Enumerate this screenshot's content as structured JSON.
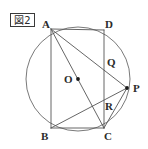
{
  "figure": {
    "caption_box": {
      "label": "図2",
      "x": 10,
      "y": 13,
      "width": 25,
      "height": 14
    },
    "canvas": {
      "width": 148,
      "height": 149,
      "background": "#ffffff"
    },
    "style": {
      "stroke_color": "#555555",
      "circle_stroke": "#6a6a6a",
      "stroke_width": 0.9,
      "label_color": "#2b2b2b",
      "dot_color": "#1a1a1a"
    },
    "circle": {
      "name": "circumscribed-circle",
      "cx": 78,
      "cy": 79,
      "r": 52
    },
    "points": [
      {
        "id": "A",
        "label": "A",
        "x": 51,
        "y": 29,
        "label_x": 42,
        "label_y": 19,
        "dot": false
      },
      {
        "id": "D",
        "label": "D",
        "x": 104,
        "y": 30,
        "label_x": 105,
        "label_y": 19,
        "dot": false
      },
      {
        "id": "B",
        "label": "B",
        "x": 51,
        "y": 128,
        "label_x": 41,
        "label_y": 131,
        "dot": false
      },
      {
        "id": "C",
        "label": "C",
        "x": 104,
        "y": 128,
        "label_x": 104,
        "label_y": 131,
        "dot": false
      },
      {
        "id": "P",
        "label": "P",
        "x": 127,
        "y": 88,
        "label_x": 133,
        "label_y": 83,
        "dot": true
      },
      {
        "id": "Q",
        "label": "Q",
        "x": 104,
        "y": 62,
        "label_x": 107,
        "label_y": 57,
        "dot": false
      },
      {
        "id": "R",
        "label": "R",
        "x": 101,
        "y": 105,
        "label_x": 105,
        "label_y": 101,
        "dot": false
      },
      {
        "id": "O",
        "label": "O",
        "x": 78,
        "y": 79,
        "label_x": 64,
        "label_y": 74,
        "dot": true
      }
    ],
    "segments": [
      {
        "name": "segment-AD",
        "from": "A",
        "to": "D"
      },
      {
        "name": "segment-AB",
        "from": "A",
        "to": "B"
      },
      {
        "name": "segment-DC",
        "from": "D",
        "to": "C"
      },
      {
        "name": "segment-BC",
        "from": "B",
        "to": "C"
      },
      {
        "name": "segment-AC",
        "from": "A",
        "to": "C"
      },
      {
        "name": "segment-AP",
        "from": "A",
        "to": "P"
      },
      {
        "name": "segment-BP",
        "from": "B",
        "to": "P"
      },
      {
        "name": "segment-CP",
        "from": "C",
        "to": "P"
      }
    ]
  }
}
